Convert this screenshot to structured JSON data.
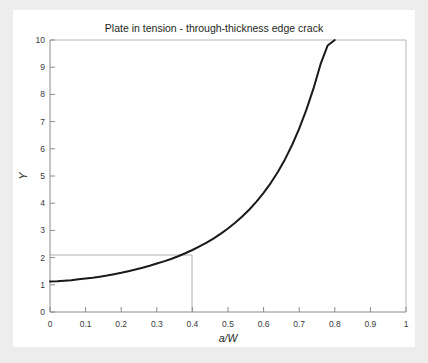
{
  "card": {
    "background_color": "#ffffff",
    "page_background_color": "#ededed"
  },
  "chart_data": {
    "type": "line",
    "title": "Plate in tension - through-thickness edge crack",
    "xlabel": "a/W",
    "ylabel": "Y",
    "xlim": [
      0,
      1
    ],
    "ylim": [
      0,
      10
    ],
    "grid": false,
    "legend": null,
    "curve_color": "#1a1a1a",
    "construction_line_color": "#b0b0b0",
    "xticks": [
      "0",
      "0.1",
      "0.2",
      "0.3",
      "0.4",
      "0.5",
      "0.6",
      "0.7",
      "0.8",
      "0.9",
      "1"
    ],
    "xtick_values": [
      0,
      0.1,
      0.2,
      0.3,
      0.4,
      0.5,
      0.6,
      0.7,
      0.8,
      0.9,
      1
    ],
    "yticks": [
      "0",
      "1",
      "2",
      "3",
      "4",
      "5",
      "6",
      "7",
      "8",
      "9",
      "10"
    ],
    "ytick_values": [
      0,
      1,
      2,
      3,
      4,
      5,
      6,
      7,
      8,
      9,
      10
    ],
    "series": [
      {
        "name": "Y",
        "x": [
          0.0,
          0.02,
          0.04,
          0.06,
          0.08,
          0.1,
          0.12,
          0.14,
          0.16,
          0.18,
          0.2,
          0.22,
          0.24,
          0.26,
          0.28,
          0.3,
          0.32,
          0.34,
          0.36,
          0.38,
          0.4,
          0.42,
          0.44,
          0.46,
          0.48,
          0.5,
          0.52,
          0.54,
          0.56,
          0.58,
          0.6,
          0.62,
          0.64,
          0.66,
          0.68,
          0.7,
          0.72,
          0.74,
          0.76,
          0.78,
          0.8,
          0.82,
          0.825
        ],
        "y": [
          1.12,
          1.13,
          1.15,
          1.17,
          1.2,
          1.23,
          1.26,
          1.3,
          1.34,
          1.39,
          1.44,
          1.5,
          1.56,
          1.63,
          1.7,
          1.78,
          1.86,
          1.95,
          2.05,
          2.16,
          2.28,
          2.41,
          2.55,
          2.71,
          2.88,
          3.07,
          3.28,
          3.51,
          3.77,
          4.06,
          4.38,
          4.74,
          5.15,
          5.61,
          6.14,
          6.74,
          7.43,
          8.21,
          9.11,
          9.8,
          10.0,
          10.0,
          10.0
        ]
      }
    ],
    "annotations": [
      {
        "type": "construction-lines",
        "x_value": 0.4,
        "y_value": 2.1,
        "description": "horizontal line from y-axis at Y = 2.1 and vertical line down to x-axis at a/W = 0.4"
      }
    ]
  }
}
